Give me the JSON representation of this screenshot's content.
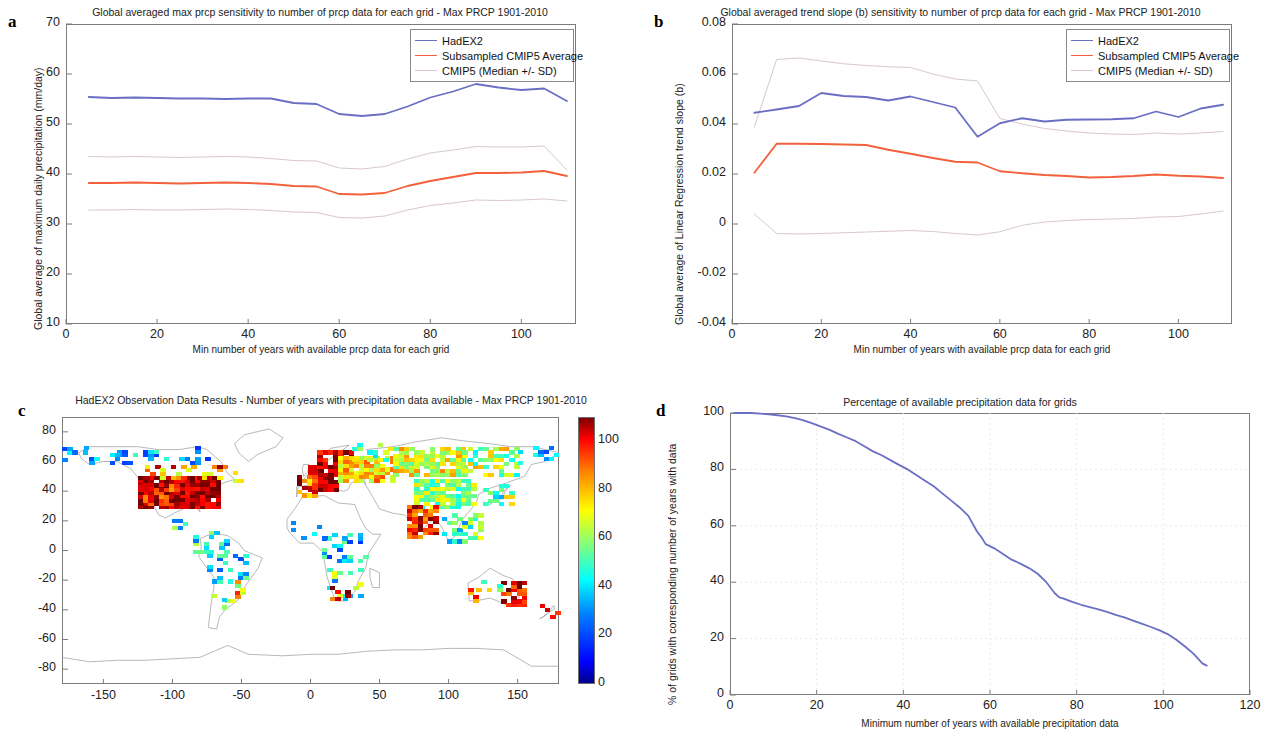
{
  "figure": {
    "colors": {
      "hadex2": "#6a6fc4",
      "cmip5_avg": "#f2603c",
      "cmip5_band": "#d9c7d2",
      "axis": "#7c7c7c",
      "grid": "#e6e6ee"
    }
  },
  "panel_a": {
    "label": "a",
    "chart_data": {
      "type": "line",
      "title": "Global averaged max prcp sensitivity to number of prcp data for each grid - Max PRCP 1901-2010",
      "xlabel": "Min number of years with available prcp data for each grid",
      "ylabel": "Global average of maximum daily precipitation (mm/day)",
      "xlim": [
        0,
        112
      ],
      "ylim": [
        10,
        70
      ],
      "xticks": [
        0,
        20,
        40,
        60,
        80,
        100
      ],
      "yticks": [
        10,
        20,
        30,
        40,
        50,
        60,
        70
      ],
      "grid": false,
      "legend_position": "top-right",
      "legend": [
        "HadEX2",
        "Subsampled CMIP5 Average",
        "CMIP5 (Median +/- SD)"
      ],
      "x": [
        5,
        10,
        15,
        20,
        25,
        30,
        35,
        40,
        45,
        50,
        55,
        60,
        65,
        70,
        75,
        80,
        85,
        90,
        95,
        100,
        105,
        110
      ],
      "series": [
        {
          "name": "HadEX2",
          "color": "#6a6fc4",
          "values": [
            55.4,
            55.2,
            55.3,
            55.2,
            55.1,
            55.1,
            55.0,
            55.1,
            55.1,
            54.2,
            54.0,
            52.0,
            51.6,
            52.0,
            53.5,
            55.3,
            56.5,
            58.0,
            57.3,
            56.8,
            57.1,
            54.6
          ]
        },
        {
          "name": "Subsampled CMIP5 Average",
          "color": "#f2603c",
          "values": [
            38.2,
            38.2,
            38.3,
            38.2,
            38.1,
            38.2,
            38.3,
            38.2,
            38.0,
            37.6,
            37.5,
            36.0,
            35.9,
            36.2,
            37.6,
            38.6,
            39.4,
            40.2,
            40.2,
            40.3,
            40.6,
            39.6
          ]
        },
        {
          "name": "CMIP5 Median + SD",
          "color": "#d9c7d2",
          "values": [
            43.5,
            43.4,
            43.5,
            43.4,
            43.3,
            43.4,
            43.5,
            43.4,
            43.1,
            42.7,
            42.6,
            41.2,
            41.0,
            41.5,
            43.0,
            44.2,
            44.8,
            45.5,
            45.4,
            45.4,
            45.6,
            40.8
          ]
        },
        {
          "name": "CMIP5 Median - SD",
          "color": "#d9c7d2",
          "values": [
            32.8,
            32.8,
            32.9,
            32.8,
            32.8,
            32.9,
            33.0,
            32.9,
            32.7,
            32.4,
            32.3,
            31.3,
            31.2,
            31.6,
            32.8,
            33.7,
            34.2,
            34.8,
            34.7,
            34.8,
            35.0,
            34.6
          ]
        }
      ]
    }
  },
  "panel_b": {
    "label": "b",
    "chart_data": {
      "type": "line",
      "title": "Global averaged trend slope (b) sensitivity to number of prcp data for each grid - Max PRCP 1901-2010",
      "xlabel": "Min number of years with available prcp data for each grid",
      "ylabel": "Global average of Linear Regression trend slope (b)",
      "xlim": [
        0,
        112
      ],
      "ylim": [
        -0.04,
        0.08
      ],
      "xticks": [
        0,
        20,
        40,
        60,
        80,
        100
      ],
      "yticks": [
        -0.04,
        -0.02,
        0,
        0.02,
        0.04,
        0.06,
        0.08
      ],
      "grid": false,
      "legend_position": "top-right",
      "legend": [
        "HadEX2",
        "Subsampled CMIP5 Average",
        "CMIP5 (Median +/- SD)"
      ],
      "x": [
        5,
        10,
        15,
        20,
        25,
        30,
        35,
        40,
        45,
        50,
        55,
        60,
        65,
        70,
        75,
        80,
        85,
        90,
        95,
        100,
        105,
        110
      ],
      "series": [
        {
          "name": "HadEX2",
          "color": "#6a6fc4",
          "values": [
            0.0445,
            0.0458,
            0.0472,
            0.0524,
            0.0512,
            0.0508,
            0.0494,
            0.051,
            0.0488,
            0.0466,
            0.0349,
            0.0403,
            0.0423,
            0.041,
            0.0417,
            0.0418,
            0.0419,
            0.0423,
            0.045,
            0.0428,
            0.0462,
            0.0477
          ]
        },
        {
          "name": "Subsampled CMIP5 Average",
          "color": "#f2603c",
          "values": [
            0.0205,
            0.0321,
            0.0321,
            0.032,
            0.0318,
            0.0316,
            0.0297,
            0.0281,
            0.0264,
            0.0249,
            0.0246,
            0.0211,
            0.0203,
            0.0196,
            0.0192,
            0.0186,
            0.0188,
            0.0192,
            0.0198,
            0.0193,
            0.019,
            0.0184
          ]
        },
        {
          "name": "CMIP5 Median + SD",
          "color": "#d9c7d2",
          "values": [
            0.0388,
            0.0658,
            0.0664,
            0.0652,
            0.0641,
            0.0634,
            0.0629,
            0.0626,
            0.06,
            0.058,
            0.0572,
            0.0422,
            0.04,
            0.0382,
            0.0372,
            0.0364,
            0.036,
            0.0358,
            0.0364,
            0.036,
            0.0364,
            0.037
          ]
        },
        {
          "name": "CMIP5 Median - SD",
          "color": "#d9c7d2",
          "values": [
            0.004,
            -0.0038,
            -0.004,
            -0.0038,
            -0.0035,
            -0.0032,
            -0.0029,
            -0.0026,
            -0.003,
            -0.0038,
            -0.0044,
            -0.0031,
            -0.0005,
            0.0008,
            0.0014,
            0.0018,
            0.002,
            0.0022,
            0.0028,
            0.003,
            0.004,
            0.0052
          ]
        }
      ]
    }
  },
  "panel_c": {
    "label": "c",
    "chart_data": {
      "type": "heatmap",
      "title": "HadEX2 Observation Data Results - Number of years with precipitation data available - Max PRCP 1901-2010",
      "xlabel": "",
      "ylabel": "",
      "xlim": [
        -180,
        180
      ],
      "ylim": [
        -90,
        90
      ],
      "xticks": [
        -150,
        -100,
        -50,
        0,
        50,
        100,
        150
      ],
      "yticks": [
        -80,
        -60,
        -40,
        -20,
        0,
        20,
        40,
        60,
        80
      ],
      "colormap": "jet",
      "colorbar": {
        "min": 0,
        "max": 110,
        "ticks": [
          0,
          20,
          40,
          60,
          80,
          100
        ]
      }
    }
  },
  "panel_d": {
    "label": "d",
    "chart_data": {
      "type": "line",
      "title": "Percentage of available precipitation data for grids",
      "xlabel": "Minimum number of years with available precipitation data",
      "ylabel": "% of grids with corresponding number of years with data",
      "xlim": [
        0,
        120
      ],
      "ylim": [
        0,
        100
      ],
      "xticks": [
        0,
        20,
        40,
        60,
        80,
        100,
        120
      ],
      "yticks": [
        0,
        20,
        40,
        60,
        80,
        100
      ],
      "grid": true,
      "series": [
        {
          "name": "% of grids",
          "color": "#6a6fc4",
          "x": [
            1,
            3,
            5,
            7,
            9,
            11,
            13,
            15,
            17,
            19,
            21,
            23,
            25,
            27,
            29,
            31,
            33,
            35,
            37,
            39,
            41,
            43,
            45,
            47,
            49,
            51,
            53,
            55,
            57,
            58,
            59,
            61,
            63,
            65,
            67,
            69,
            71,
            73,
            75,
            76,
            77,
            79,
            81,
            83,
            85,
            87,
            89,
            91,
            93,
            95,
            97,
            99,
            101,
            103,
            105,
            107,
            109,
            110
          ],
          "values": [
            100,
            100,
            100,
            99.8,
            99.5,
            99.2,
            98.8,
            98.2,
            97.4,
            96.3,
            95.2,
            94.0,
            92.6,
            91.3,
            90.0,
            88.2,
            86.4,
            85.0,
            83.3,
            81.6,
            80.0,
            78.0,
            76.0,
            74.0,
            71.5,
            69.0,
            66.5,
            63.5,
            58.0,
            56.0,
            53.5,
            52.0,
            50.0,
            48.0,
            46.6,
            45.0,
            43.0,
            40.0,
            36.0,
            34.6,
            34.2,
            33.0,
            32.0,
            31.2,
            30.4,
            29.5,
            28.4,
            27.5,
            26.4,
            25.3,
            24.2,
            23.0,
            21.6,
            19.6,
            17.2,
            14.6,
            11.2,
            10.4
          ]
        }
      ]
    }
  }
}
